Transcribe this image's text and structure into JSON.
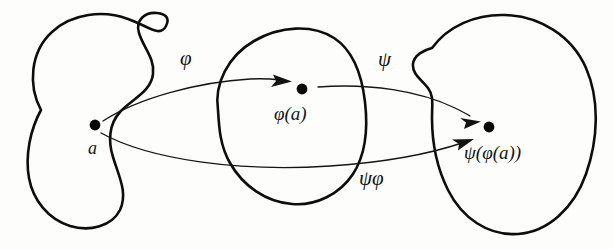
{
  "diagram": {
    "background_color": "#fdfdfc",
    "ink_color": "#0d0d0d",
    "sets": [
      {
        "name": "domain-set",
        "shape": "peanut-blob",
        "contains_point": "a"
      },
      {
        "name": "codomain-set",
        "shape": "tilted-oval-blob",
        "contains_point": "phi(a)"
      },
      {
        "name": "target-set",
        "shape": "bean-blob",
        "contains_point": "psi(phi(a))"
      }
    ],
    "points": [
      {
        "id": "a",
        "label": "a",
        "x": 95,
        "y": 125
      },
      {
        "id": "phi_a",
        "label": "φ(a)",
        "x": 302,
        "y": 89
      },
      {
        "id": "psi_phi_a",
        "label": "ψ(φ(a))",
        "x": 489,
        "y": 127
      }
    ],
    "arrows": [
      {
        "id": "arrow-phi",
        "label": "φ",
        "from": "a",
        "to": "phi_a",
        "label_x": 188,
        "label_y": 59
      },
      {
        "id": "arrow-psi",
        "label": "ψ",
        "from": "phi_a",
        "to": "psi_phi_a",
        "label_x": 385,
        "label_y": 60
      },
      {
        "id": "arrow-psi-phi",
        "label": "ψφ",
        "from": "a",
        "to": "psi_phi_a",
        "label_x": 372,
        "label_y": 179
      }
    ]
  },
  "labels": {
    "phi": "φ",
    "psi": "ψ",
    "psi_phi": "ψφ",
    "point_a": "a",
    "point_phi_a": "φ(a)",
    "point_psi_phi_a": "ψ(φ(a))"
  }
}
